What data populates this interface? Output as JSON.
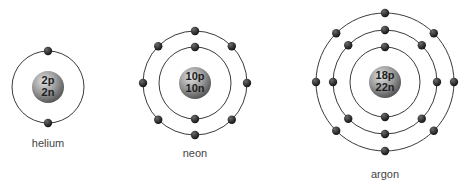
{
  "atoms": [
    {
      "name": "helium",
      "label": "helium",
      "protons_label": "2p",
      "neutrons_label": "2n",
      "shells": [
        2
      ]
    },
    {
      "name": "neon",
      "label": "neon",
      "protons_label": "10p",
      "neutrons_label": "10n",
      "shells": [
        2,
        8
      ]
    },
    {
      "name": "argon",
      "label": "argon",
      "protons_label": "18p",
      "neutrons_label": "22n",
      "shells": [
        2,
        8,
        8
      ]
    }
  ],
  "colors": {
    "orbit": "#3a3a3a",
    "electron": "#2a2a2a",
    "nucleus_light": "#d0d0d0",
    "nucleus_dark": "#606060",
    "label": "#444444"
  }
}
